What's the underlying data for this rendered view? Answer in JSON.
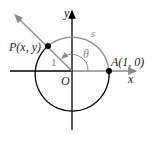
{
  "diagram": {
    "axis_x_label": "x",
    "axis_y_label": "y",
    "origin_label": "O",
    "point_p_label": "P(x, y)",
    "point_a_label": "A(1, 0)",
    "arc_label": "s",
    "angle_label": "θ",
    "radius_label": "1",
    "colors": {
      "axis": "#000000",
      "gray": "#8a8a8a",
      "point": "#000000"
    }
  }
}
